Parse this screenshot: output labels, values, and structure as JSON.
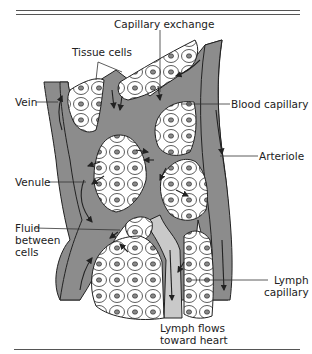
{
  "figure": {
    "colors": {
      "vessel": "#8c8c8c",
      "lymph": "#c9c9c9",
      "cell_fill": "#ffffff",
      "outline": "#222222"
    }
  },
  "labels": {
    "capillary_exchange": "Capillary exchange",
    "tissue_cells": "Tissue cells",
    "vein": "Vein",
    "blood_capillary": "Blood capillary",
    "arteriole": "Arteriole",
    "venule": "Venule",
    "fluid_between_cells": "Fluid\nbetween\ncells",
    "lymph_capillary": "Lymph\ncapillary",
    "lymph_flows": "Lymph flows\ntoward heart"
  }
}
